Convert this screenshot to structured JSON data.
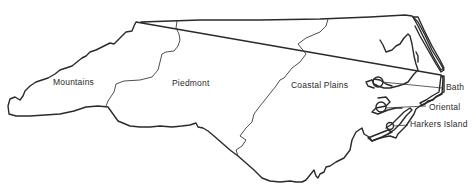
{
  "map": {
    "subject": "North Carolina",
    "regions": [
      {
        "id": "mountains",
        "label": "Mountains"
      },
      {
        "id": "piedmont",
        "label": "Piedmont"
      },
      {
        "id": "coastal-plains",
        "label": "Coastal Plains"
      }
    ],
    "places": [
      {
        "id": "bath",
        "label": "Bath"
      },
      {
        "id": "oriental",
        "label": "Oriental"
      },
      {
        "id": "harkers-island",
        "label": "Harkers Island"
      }
    ],
    "colors": {
      "line": "#2a2a2a",
      "background": "#ffffff",
      "text": "#2a2a2a"
    }
  }
}
